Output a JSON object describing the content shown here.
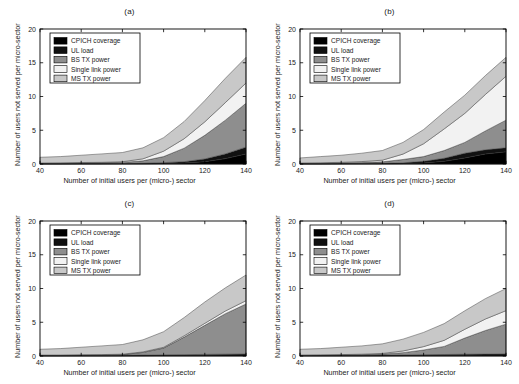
{
  "figure": {
    "width": 519,
    "height": 384,
    "background": "#ffffff",
    "panel_count": 4
  },
  "axes": {
    "xlabel": "Number of initial users per (micro-) sector",
    "ylabel": "Number of users not served per micro-sector",
    "xticks": [
      40,
      60,
      80,
      100,
      120,
      140
    ],
    "yticks": [
      0,
      5,
      10,
      15,
      20
    ],
    "xlim": [
      40,
      140
    ],
    "ylim": [
      0,
      20
    ],
    "grid": false
  },
  "legend": {
    "position": "upper left",
    "entries": [
      {
        "label": "CPICH coverage",
        "color": "#000000"
      },
      {
        "label": "UL load",
        "color": "#111111"
      },
      {
        "label": "BS TX power",
        "color": "#8e8e8e"
      },
      {
        "label": "Single link power",
        "color": "#f2f2f2"
      },
      {
        "label": "MS TX power",
        "color": "#c8c8c8"
      }
    ]
  },
  "panels": [
    {
      "id": "a",
      "title": "(a)"
    },
    {
      "id": "b",
      "title": "(b)"
    },
    {
      "id": "c",
      "title": "(c)"
    },
    {
      "id": "d",
      "title": "(d)"
    }
  ],
  "chart_data": [
    {
      "type": "area",
      "stacked": true,
      "title": "(a)",
      "xlabel": "Number of initial users per (micro-) sector",
      "ylabel": "Number of users not served per micro-sector",
      "xlim": [
        40,
        140
      ],
      "ylim": [
        0,
        20
      ],
      "x": [
        40,
        50,
        60,
        70,
        80,
        90,
        100,
        110,
        120,
        130,
        140
      ],
      "series": [
        {
          "name": "CPICH coverage",
          "values": [
            0.02,
            0.02,
            0.03,
            0.03,
            0.04,
            0.05,
            0.08,
            0.15,
            0.35,
            0.8,
            1.5
          ]
        },
        {
          "name": "UL load",
          "values": [
            0.03,
            0.03,
            0.04,
            0.04,
            0.05,
            0.07,
            0.12,
            0.2,
            0.4,
            0.7,
            1.0
          ]
        },
        {
          "name": "BS TX power",
          "values": [
            0.05,
            0.06,
            0.08,
            0.1,
            0.15,
            0.35,
            0.9,
            2.0,
            3.5,
            5.0,
            6.5
          ]
        },
        {
          "name": "Single link power",
          "values": [
            0.05,
            0.06,
            0.07,
            0.08,
            0.1,
            0.3,
            0.8,
            1.4,
            2.0,
            2.6,
            3.0
          ]
        },
        {
          "name": "MS TX power",
          "values": [
            0.85,
            0.93,
            1.08,
            1.25,
            1.36,
            1.63,
            2.0,
            2.55,
            3.15,
            3.6,
            3.8
          ]
        }
      ],
      "totals": [
        1.0,
        1.1,
        1.3,
        1.5,
        1.7,
        2.4,
        3.9,
        6.3,
        9.4,
        12.7,
        15.8
      ]
    },
    {
      "type": "area",
      "stacked": true,
      "title": "(b)",
      "xlabel": "Number of initial users per (micro-) sector",
      "ylabel": "Number of users not served per micro-sector",
      "xlim": [
        40,
        140
      ],
      "ylim": [
        0,
        20
      ],
      "x": [
        40,
        50,
        60,
        70,
        80,
        90,
        100,
        110,
        120,
        130,
        140
      ],
      "series": [
        {
          "name": "CPICH coverage",
          "values": [
            0.02,
            0.02,
            0.03,
            0.04,
            0.05,
            0.07,
            0.15,
            0.4,
            0.9,
            1.5,
            1.8
          ]
        },
        {
          "name": "UL load",
          "values": [
            0.03,
            0.03,
            0.04,
            0.05,
            0.07,
            0.1,
            0.25,
            0.45,
            0.7,
            0.6,
            0.6
          ]
        },
        {
          "name": "BS TX power",
          "values": [
            0.05,
            0.06,
            0.08,
            0.12,
            0.2,
            0.5,
            0.7,
            1.15,
            1.6,
            2.8,
            4.1
          ]
        },
        {
          "name": "Single link power",
          "values": [
            0.05,
            0.07,
            0.1,
            0.15,
            0.25,
            0.8,
            1.9,
            3.2,
            4.3,
            5.4,
            6.5
          ]
        },
        {
          "name": "MS TX power",
          "values": [
            0.75,
            0.92,
            1.05,
            1.24,
            1.43,
            1.73,
            2.1,
            2.5,
            2.7,
            2.8,
            2.8
          ]
        }
      ],
      "totals": [
        0.9,
        1.1,
        1.3,
        1.6,
        2.0,
        3.2,
        5.1,
        7.7,
        10.2,
        13.1,
        15.8
      ]
    },
    {
      "type": "area",
      "stacked": true,
      "title": "(c)",
      "xlabel": "Number of initial users per (micro-) sector",
      "ylabel": "Number of users not served per micro-sector",
      "xlim": [
        40,
        140
      ],
      "ylim": [
        0,
        20
      ],
      "x": [
        40,
        50,
        60,
        70,
        80,
        90,
        100,
        110,
        120,
        130,
        140
      ],
      "series": [
        {
          "name": "CPICH coverage",
          "values": [
            0.03,
            0.03,
            0.04,
            0.04,
            0.05,
            0.06,
            0.08,
            0.1,
            0.12,
            0.14,
            0.16
          ]
        },
        {
          "name": "UL load",
          "values": [
            0.04,
            0.04,
            0.05,
            0.05,
            0.06,
            0.07,
            0.09,
            0.1,
            0.12,
            0.13,
            0.14
          ]
        },
        {
          "name": "BS TX power",
          "values": [
            0.03,
            0.04,
            0.05,
            0.07,
            0.1,
            0.4,
            1.0,
            2.6,
            4.3,
            6.0,
            7.4
          ]
        },
        {
          "name": "Single link power",
          "values": [
            0.04,
            0.04,
            0.05,
            0.05,
            0.06,
            0.08,
            0.12,
            0.2,
            0.3,
            0.4,
            0.5
          ]
        },
        {
          "name": "MS TX power",
          "values": [
            0.86,
            0.95,
            1.11,
            1.29,
            1.43,
            1.79,
            2.31,
            2.7,
            3.16,
            3.43,
            3.8
          ]
        }
      ],
      "totals": [
        1.0,
        1.1,
        1.3,
        1.5,
        1.7,
        2.4,
        3.6,
        5.7,
        8.0,
        10.1,
        12.0
      ]
    },
    {
      "type": "area",
      "stacked": true,
      "title": "(d)",
      "xlabel": "Number of initial users per (micro-) sector",
      "ylabel": "Number of users not served per micro-sector",
      "xlim": [
        40,
        140
      ],
      "ylim": [
        0,
        20
      ],
      "x": [
        40,
        50,
        60,
        70,
        80,
        90,
        100,
        110,
        120,
        130,
        140
      ],
      "series": [
        {
          "name": "CPICH coverage",
          "values": [
            0.04,
            0.04,
            0.05,
            0.05,
            0.06,
            0.07,
            0.09,
            0.1,
            0.12,
            0.13,
            0.15
          ]
        },
        {
          "name": "UL load",
          "values": [
            0.05,
            0.05,
            0.05,
            0.06,
            0.07,
            0.08,
            0.1,
            0.12,
            0.14,
            0.15,
            0.17
          ]
        },
        {
          "name": "BS TX power",
          "values": [
            0.03,
            0.04,
            0.06,
            0.09,
            0.15,
            0.35,
            0.7,
            1.2,
            2.4,
            3.5,
            4.4
          ]
        },
        {
          "name": "Single link power",
          "values": [
            0.03,
            0.04,
            0.05,
            0.07,
            0.1,
            0.25,
            0.5,
            0.9,
            1.3,
            1.7,
            2.0
          ]
        },
        {
          "name": "MS TX power",
          "values": [
            0.85,
            0.93,
            1.09,
            1.23,
            1.42,
            1.75,
            2.11,
            2.48,
            2.74,
            3.02,
            3.28
          ]
        }
      ],
      "totals": [
        1.0,
        1.1,
        1.3,
        1.5,
        1.8,
        2.5,
        3.5,
        4.8,
        6.7,
        8.5,
        10.0
      ]
    }
  ]
}
